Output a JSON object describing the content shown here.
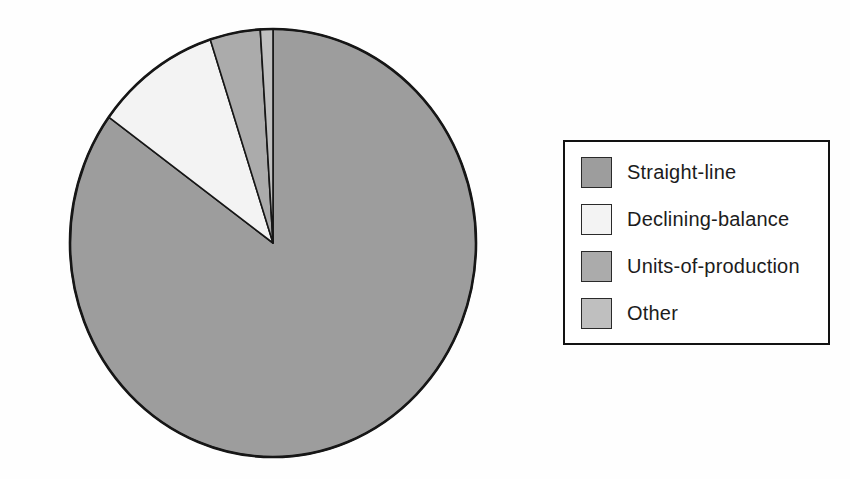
{
  "chart_data": {
    "type": "pie",
    "title": "",
    "categories": [
      "Straight-line",
      "Declining-balance",
      "Units-of-production",
      "Other"
    ],
    "values": [
      85,
      10,
      4,
      1
    ],
    "unit": "percent_share_estimated_from_slice_angles",
    "start_angle_deg": 0,
    "direction": "clockwise",
    "legend_position": "right",
    "colors": [
      "#9d9d9d",
      "#f3f3f3",
      "#ababab",
      "#bfbfbf"
    ],
    "outline_color": "#161616"
  },
  "legend": {
    "items": [
      {
        "label": "Straight-line",
        "color": "#9d9d9d"
      },
      {
        "label": "Declining-balance",
        "color": "#f3f3f3"
      },
      {
        "label": "Units-of-production",
        "color": "#ababab"
      },
      {
        "label": "Other",
        "color": "#bfbfbf"
      }
    ]
  }
}
